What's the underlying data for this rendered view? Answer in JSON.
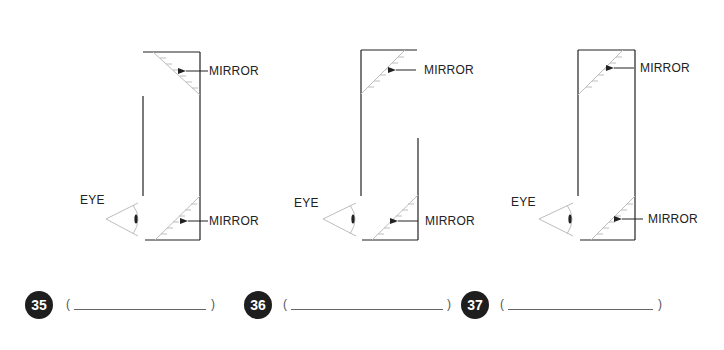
{
  "diagrams": [
    {
      "id": 35,
      "eye_label": "EYE",
      "top_mirror_label": "MIRROR",
      "bottom_mirror_label": "MIRROR",
      "top_mirror_orientation": "slopes down-right (/ reversed)",
      "bottom_mirror_orientation": "slopes up-right"
    },
    {
      "id": 36,
      "eye_label": "EYE",
      "top_mirror_label": "MIRROR",
      "bottom_mirror_label": "MIRROR",
      "top_mirror_orientation": "slopes up-right",
      "bottom_mirror_orientation": "slopes up-right"
    },
    {
      "id": 37,
      "eye_label": "EYE",
      "top_mirror_label": "MIRROR",
      "bottom_mirror_label": "MIRROR",
      "top_mirror_orientation": "slopes up-right",
      "bottom_mirror_orientation": "slopes up-right"
    }
  ],
  "answers": [
    {
      "number": "35",
      "open": "(",
      "close": ")",
      "value": ""
    },
    {
      "number": "36",
      "open": "(",
      "close": ")",
      "value": ""
    },
    {
      "number": "37",
      "open": "(",
      "close": ")",
      "value": ""
    }
  ],
  "colors": {
    "line": "#222222",
    "mirror": "#bdbdbd",
    "eye": "#bdbdbd",
    "badge": "#1e1e1e"
  }
}
